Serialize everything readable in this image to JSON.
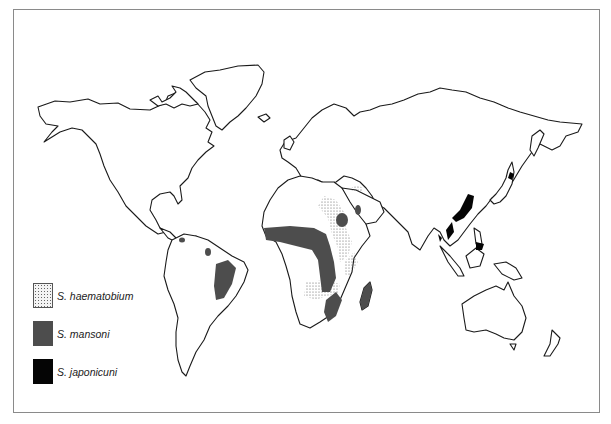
{
  "map": {
    "type": "world distribution map",
    "subject": "Schistosomiasis species distribution",
    "colors": {
      "background": "#ffffff",
      "outline": "#1a1a1a",
      "haematobium_fill": "dotted-stipple",
      "mansoni_fill": "#4d4d4d",
      "japonicum_fill": "#050505"
    },
    "regions": {
      "haematobium": [
        "North Africa (Nile)",
        "East Africa",
        "Southern Africa",
        "Middle East"
      ],
      "mansoni": [
        "West/Central Africa band",
        "Arabian Peninsula",
        "Madagascar",
        "Southeast Africa",
        "Eastern Brazil",
        "Venezuela",
        "Caribbean"
      ],
      "japonicum": [
        "Eastern China",
        "Japan",
        "Philippines",
        "Indonesia (Sulawesi)"
      ]
    }
  },
  "legend": {
    "items": [
      {
        "label": "S. haematobium",
        "swatch": "dotted"
      },
      {
        "label": "S. mansoni",
        "swatch": "dark-gray"
      },
      {
        "label": "S. japonicuni",
        "swatch": "black"
      }
    ]
  }
}
